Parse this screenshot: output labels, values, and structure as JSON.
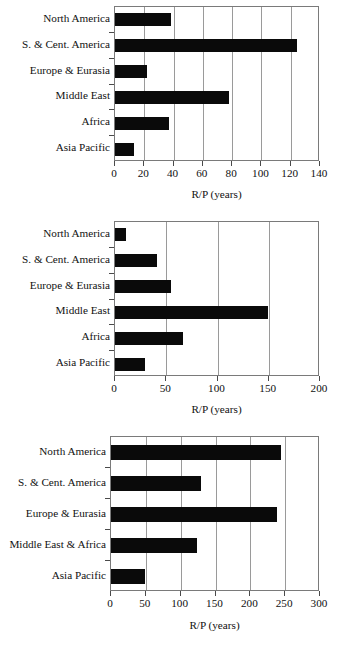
{
  "figure": {
    "background": "#ffffff",
    "bar_color": "#0a0a0a",
    "frame_color": "#7a7a7a",
    "grid_color": "#9a9a9a",
    "panel_count": 3
  },
  "chart_data": [
    {
      "type": "bar",
      "orientation": "horizontal",
      "title": "",
      "subtitle": "",
      "xlabel": "R/P (years)",
      "ylabel": "",
      "categories": [
        "North America",
        "S. & Cent. America",
        "Europe & Eurasia",
        "Middle East",
        "Africa",
        "Asia Pacific"
      ],
      "values": [
        38,
        124,
        22,
        78,
        37,
        13
      ],
      "xlim": [
        0,
        140
      ],
      "xticks": [
        0,
        20,
        40,
        60,
        80,
        100,
        120,
        140
      ],
      "xticklabels": [
        "0",
        "20",
        "40",
        "60",
        "80",
        "100",
        "120",
        "140"
      ],
      "grid": "vertical",
      "legend": "none"
    },
    {
      "type": "bar",
      "orientation": "horizontal",
      "title": "",
      "subtitle": "",
      "xlabel": "R/P (years)",
      "ylabel": "",
      "categories": [
        "North America",
        "S. & Cent. America",
        "Europe & Eurasia",
        "Middle East",
        "Africa",
        "Asia Pacific"
      ],
      "values": [
        11,
        41,
        55,
        149,
        66,
        29
      ],
      "xlim": [
        0,
        200
      ],
      "xticks": [
        0,
        50,
        100,
        150,
        200
      ],
      "xticklabels": [
        "0",
        "50",
        "100",
        "150",
        "200"
      ],
      "grid": "vertical",
      "legend": "none"
    },
    {
      "type": "bar",
      "orientation": "horizontal",
      "title": "",
      "subtitle": "",
      "xlabel": "R/P (years)",
      "ylabel": "",
      "categories": [
        "North America",
        "S. & Cent. America",
        "Europe & Eurasia",
        "Middle East & Africa",
        "Asia Pacific"
      ],
      "values": [
        244,
        129,
        238,
        124,
        49
      ],
      "xlim": [
        0,
        300
      ],
      "xticks": [
        0,
        50,
        100,
        150,
        200,
        250,
        300
      ],
      "xticklabels": [
        "0",
        "50",
        "100",
        "150",
        "200",
        "250",
        "300"
      ],
      "grid": "vertical",
      "legend": "none"
    }
  ]
}
